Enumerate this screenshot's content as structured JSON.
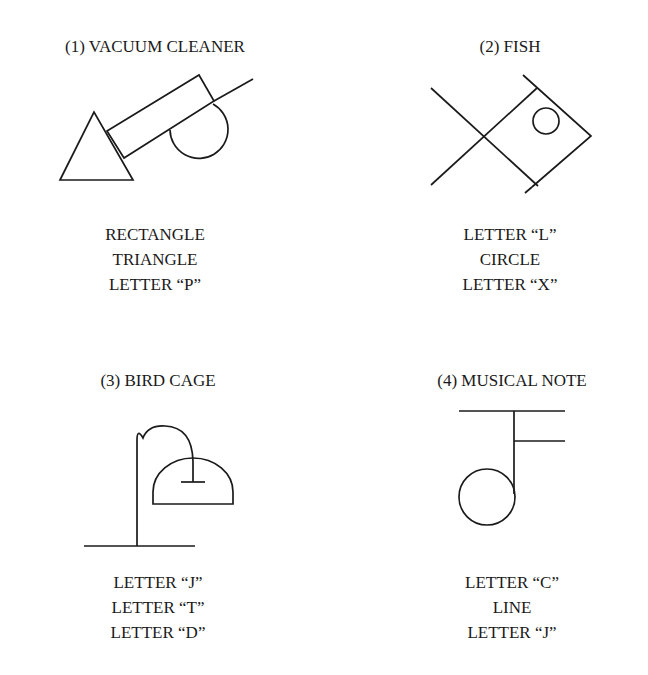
{
  "figures": [
    {
      "title": "(1) VACUUM CLEANER",
      "parts": [
        "RECTANGLE",
        "TRIANGLE",
        "LETTER “P”"
      ]
    },
    {
      "title": "(2) FISH",
      "parts": [
        "LETTER “L”",
        "CIRCLE",
        "LETTER “X”"
      ]
    },
    {
      "title": "(3) BIRD CAGE",
      "parts": [
        "LETTER “J”",
        "LETTER “T”",
        "LETTER “D”"
      ]
    },
    {
      "title": "(4) MUSICAL NOTE",
      "parts": [
        "LETTER “C”",
        "LINE",
        "LETTER “J”"
      ]
    }
  ]
}
